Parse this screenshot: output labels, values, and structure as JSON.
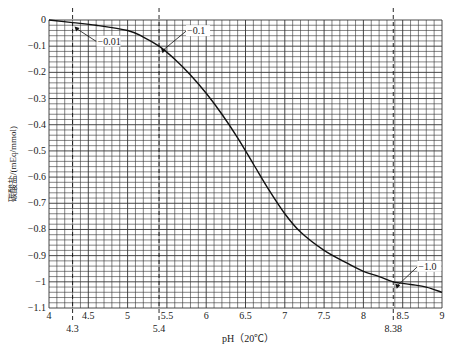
{
  "chart_data": {
    "type": "line",
    "title": "",
    "xlabel": "pH（20℃）",
    "ylabel": "碳酸盐/(mEq/mmol)",
    "xlim": [
      4,
      9
    ],
    "ylim": [
      -1.1,
      0
    ],
    "grid": true,
    "x_ticks": [
      "4",
      "4.5",
      "5",
      "5.5",
      "6",
      "6.5",
      "7",
      "7.5",
      "8",
      "8.5",
      "9"
    ],
    "y_ticks": [
      "0",
      "−0.1",
      "−0.2",
      "−0.3",
      "−0.4",
      "−0.5",
      "−0.6",
      "−0.7",
      "−0.8",
      "−0.9",
      "−1",
      "−1.1"
    ],
    "series": [
      {
        "name": "carbonate",
        "x": [
          4.0,
          4.3,
          4.6,
          5.0,
          5.2,
          5.4,
          5.6,
          5.8,
          6.0,
          6.2,
          6.4,
          6.6,
          6.8,
          7.0,
          7.2,
          7.5,
          7.8,
          8.0,
          8.2,
          8.38,
          8.6,
          8.8,
          9.0
        ],
        "values": [
          0.0,
          -0.01,
          -0.02,
          -0.04,
          -0.065,
          -0.1,
          -0.15,
          -0.21,
          -0.28,
          -0.36,
          -0.45,
          -0.55,
          -0.65,
          -0.74,
          -0.81,
          -0.88,
          -0.93,
          -0.96,
          -0.98,
          -1.0,
          -1.01,
          -1.02,
          -1.04
        ]
      }
    ],
    "annotations": [
      {
        "text": "−0.01",
        "x": 4.3,
        "y": -0.01
      },
      {
        "text": "−0.1",
        "x": 5.4,
        "y": -0.1
      },
      {
        "text": "−1.0",
        "x": 8.38,
        "y": -1.0
      }
    ],
    "reference_lines": [
      {
        "x": 4.3,
        "label": "4.3"
      },
      {
        "x": 5.4,
        "label": "5.4"
      },
      {
        "x": 8.38,
        "label": "8.38"
      }
    ]
  }
}
